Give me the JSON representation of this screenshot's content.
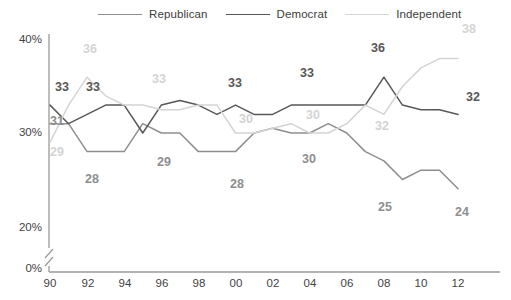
{
  "chart_data": {
    "type": "line",
    "title": "",
    "xlabel": "",
    "ylabel": "",
    "ylim": [
      20,
      41
    ],
    "xlim": [
      1990,
      2012.8
    ],
    "grid": false,
    "legend_position": "top-center",
    "y_ticks": [
      "40%",
      "30%",
      "20%",
      "0%"
    ],
    "y_tick_values": [
      40,
      30,
      20,
      0
    ],
    "axis_break": true,
    "x_ticks": [
      "90",
      "92",
      "94",
      "96",
      "98",
      "00",
      "02",
      "04",
      "06",
      "08",
      "10",
      "12"
    ],
    "x_tick_values": [
      1990,
      1992,
      1994,
      1996,
      1998,
      2000,
      2002,
      2004,
      2006,
      2008,
      2010,
      2012
    ],
    "x": [
      1990,
      1991,
      1992,
      1993,
      1994,
      1995,
      1996,
      1997,
      1998,
      1999,
      2000,
      2001,
      2002,
      2003,
      2004,
      2005,
      2006,
      2007,
      2008,
      2009,
      2010,
      2011,
      2012
    ],
    "series": [
      {
        "name": "Republican",
        "color": "#8e8e8e",
        "values": [
          31,
          31,
          28,
          28,
          28,
          31,
          30,
          30,
          28,
          28,
          28,
          30,
          30.5,
          30,
          30,
          31,
          30,
          28,
          27,
          25,
          26,
          26,
          24
        ]
      },
      {
        "name": "Democrat",
        "color": "#585858",
        "values": [
          33,
          31,
          32,
          33,
          33,
          30,
          33,
          33.5,
          33,
          32,
          33,
          32,
          32,
          33,
          33,
          33,
          33,
          33,
          36,
          33,
          32.5,
          32.5,
          32
        ]
      },
      {
        "name": "Independent",
        "color": "#d4d4d4",
        "values": [
          29,
          33,
          36,
          34,
          33,
          33,
          32.5,
          32.5,
          33,
          33,
          30,
          30,
          30.5,
          31,
          30,
          30,
          31,
          33,
          32,
          35,
          37,
          38,
          38
        ]
      }
    ],
    "annotations": [
      {
        "text": "33",
        "series": "Democrat",
        "x": 1990,
        "value": 33,
        "px": 55,
        "py": 80,
        "color": "#585858"
      },
      {
        "text": "31",
        "series": "Republican",
        "x": 1990,
        "value": 31,
        "px": 50,
        "py": 114,
        "color": "#8e8e8e"
      },
      {
        "text": "29",
        "series": "Independent",
        "x": 1990,
        "value": 29,
        "px": 50,
        "py": 145,
        "color": "#d4d4d4"
      },
      {
        "text": "36",
        "series": "Independent",
        "x": 1992,
        "value": 36,
        "px": 83,
        "py": 42,
        "color": "#d4d4d4"
      },
      {
        "text": "33",
        "series": "Democrat",
        "x": 1993,
        "value": 33,
        "px": 86,
        "py": 80,
        "color": "#585858"
      },
      {
        "text": "28",
        "series": "Republican",
        "x": 1993,
        "value": 28,
        "px": 85,
        "py": 172,
        "color": "#8e8e8e"
      },
      {
        "text": "33",
        "series": "Independent",
        "x": 1996,
        "value": 33,
        "px": 152,
        "py": 72,
        "color": "#d4d4d4"
      },
      {
        "text": "29",
        "series": "Republican",
        "x": 1996,
        "value": 29,
        "px": 157,
        "py": 155,
        "color": "#8e8e8e"
      },
      {
        "text": "33",
        "series": "Democrat",
        "x": 1999,
        "value": 33,
        "px": 228,
        "py": 76,
        "color": "#585858"
      },
      {
        "text": "28",
        "series": "Republican",
        "x": 1999,
        "value": 28,
        "px": 230,
        "py": 177,
        "color": "#8e8e8e"
      },
      {
        "text": "30",
        "series": "Independent",
        "x": 2001,
        "value": 30,
        "px": 239,
        "py": 112,
        "color": "#d4d4d4"
      },
      {
        "text": "33",
        "series": "Democrat",
        "x": 2004,
        "value": 33,
        "px": 300,
        "py": 66,
        "color": "#585858"
      },
      {
        "text": "30",
        "series": "Independent",
        "x": 2004,
        "value": 30,
        "px": 306,
        "py": 108,
        "color": "#d4d4d4"
      },
      {
        "text": "30",
        "series": "Republican",
        "x": 2005,
        "value": 30,
        "px": 302,
        "py": 152,
        "color": "#8e8e8e"
      },
      {
        "text": "36",
        "series": "Democrat",
        "x": 2008,
        "value": 36,
        "px": 371,
        "py": 41,
        "color": "#585858"
      },
      {
        "text": "32",
        "series": "Independent",
        "x": 2008,
        "value": 32,
        "px": 375,
        "py": 119,
        "color": "#d4d4d4"
      },
      {
        "text": "25",
        "series": "Republican",
        "x": 2009,
        "value": 25,
        "px": 378,
        "py": 200,
        "color": "#8e8e8e"
      },
      {
        "text": "38",
        "series": "Independent",
        "x": 2012,
        "value": 38,
        "px": 462,
        "py": 22,
        "color": "#d4d4d4"
      },
      {
        "text": "32",
        "series": "Democrat",
        "x": 2012,
        "value": 32,
        "px": 466,
        "py": 90,
        "color": "#585858"
      },
      {
        "text": "24",
        "series": "Republican",
        "x": 2012,
        "value": 24,
        "px": 455,
        "py": 205,
        "color": "#8e8e8e"
      }
    ]
  },
  "legend": {
    "entries": [
      {
        "label": "Republican",
        "color": "#8e8e8e"
      },
      {
        "label": "Democrat",
        "color": "#585858"
      },
      {
        "label": "Independent",
        "color": "#d4d4d4"
      }
    ]
  },
  "axes": {
    "y_labels": [
      {
        "text": "40%",
        "py": 33
      },
      {
        "text": "30%",
        "py": 126
      },
      {
        "text": "20%",
        "py": 221
      },
      {
        "text": "0%",
        "py": 262
      }
    ],
    "x_labels": [
      {
        "text": "90",
        "px": 50
      },
      {
        "text": "92",
        "px": 88
      },
      {
        "text": "94",
        "px": 125
      },
      {
        "text": "96",
        "px": 162
      },
      {
        "text": "98",
        "px": 199
      },
      {
        "text": "00",
        "px": 236
      },
      {
        "text": "02",
        "px": 273
      },
      {
        "text": "04",
        "px": 310
      },
      {
        "text": "06",
        "px": 347
      },
      {
        "text": "08",
        "px": 384
      },
      {
        "text": "10",
        "px": 421
      },
      {
        "text": "12",
        "px": 458
      }
    ],
    "axis_color": "#9a9a9a"
  }
}
